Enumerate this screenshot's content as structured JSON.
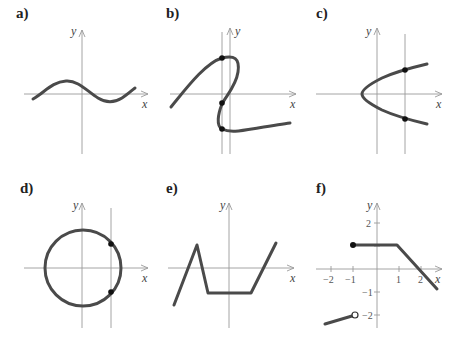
{
  "panels": [
    {
      "label": "a)",
      "x_axis": "x",
      "y_axis": "y",
      "curve": "sine-like wave"
    },
    {
      "label": "b)",
      "x_axis": "x",
      "y_axis": "y",
      "curve": "S-shaped curve crossed by vertical line at three points"
    },
    {
      "label": "c)",
      "x_axis": "x",
      "y_axis": "y",
      "curve": "sideways parabola crossed by vertical line at two points"
    },
    {
      "label": "d)",
      "x_axis": "x",
      "y_axis": "y",
      "curve": "circle crossed by vertical line at two points"
    },
    {
      "label": "e)",
      "x_axis": "x",
      "y_axis": "y",
      "curve": "piecewise linear"
    },
    {
      "label": "f)",
      "x_axis": "x",
      "y_axis": "y",
      "curve": "piecewise linear with closed dot at (-1,1) and open dot at (-1,-2)",
      "x_ticks": [
        "−2",
        "−1",
        "1",
        "2"
      ],
      "y_ticks": [
        "2",
        "−1",
        "−2"
      ]
    }
  ]
}
